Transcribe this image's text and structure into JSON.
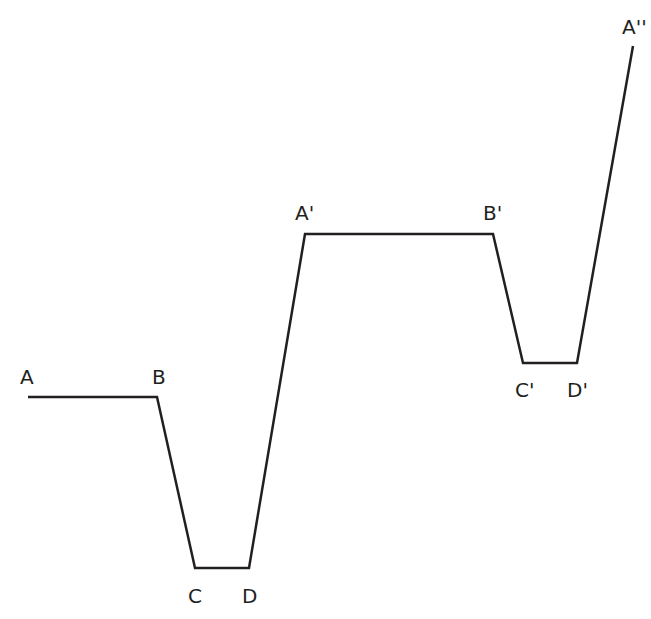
{
  "diagram": {
    "type": "piecewise-path",
    "stroke_color": "#231f20",
    "background": "#ffffff",
    "points": [
      {
        "id": "A",
        "label": "A",
        "x": 28,
        "y": 397,
        "lx": 20,
        "ly": 384
      },
      {
        "id": "B",
        "label": "B",
        "x": 157,
        "y": 397,
        "lx": 152,
        "ly": 384
      },
      {
        "id": "C",
        "label": "C",
        "x": 195,
        "y": 568,
        "lx": 188,
        "ly": 603
      },
      {
        "id": "D",
        "label": "D",
        "x": 249,
        "y": 568,
        "lx": 242,
        "ly": 603
      },
      {
        "id": "A1",
        "label": "A'",
        "x": 305,
        "y": 234,
        "lx": 295,
        "ly": 220
      },
      {
        "id": "B1",
        "label": "B'",
        "x": 493,
        "y": 234,
        "lx": 483,
        "ly": 220
      },
      {
        "id": "C1",
        "label": "C'",
        "x": 523,
        "y": 363,
        "lx": 515,
        "ly": 397
      },
      {
        "id": "D1",
        "label": "D'",
        "x": 577,
        "y": 363,
        "lx": 567,
        "ly": 397
      },
      {
        "id": "A2",
        "label": "A''",
        "x": 633,
        "y": 46,
        "lx": 622,
        "ly": 34
      }
    ]
  }
}
